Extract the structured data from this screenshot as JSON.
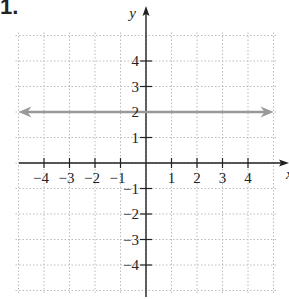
{
  "problem_label": "1.",
  "chart_data": {
    "type": "line",
    "title": "",
    "xlabel": "x",
    "ylabel": "y",
    "xlim": [
      -5,
      5
    ],
    "ylim": [
      -5,
      5
    ],
    "grid": true,
    "x_ticks": [
      -4,
      -3,
      -2,
      -1,
      1,
      2,
      3,
      4
    ],
    "y_ticks": [
      -4,
      -3,
      -2,
      -1,
      1,
      2,
      3,
      4
    ],
    "x_tick_labels": [
      "−4",
      "−3",
      "−2",
      "−1",
      "1",
      "2",
      "3",
      "4"
    ],
    "y_tick_labels": [
      "−4",
      "−3",
      "−2",
      "−1",
      "1",
      "2",
      "3",
      "4"
    ],
    "series": [
      {
        "name": "y = 2",
        "equation": "y = 2",
        "x": [
          -5,
          5
        ],
        "y": [
          2,
          2
        ],
        "color": "#999999",
        "arrows_both_ends": true
      }
    ],
    "colors": {
      "axis": "#222222",
      "grid": "#bbbbbb",
      "line": "#999999"
    }
  }
}
